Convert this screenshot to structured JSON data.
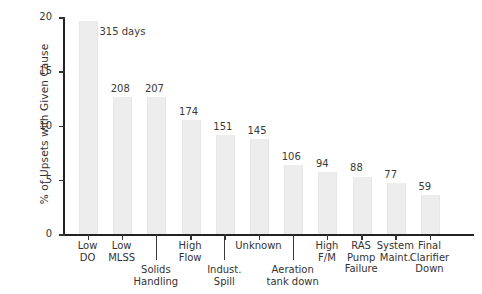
{
  "chart_data": {
    "type": "bar",
    "title": "",
    "xlabel": "",
    "ylabel": "% of Upsets with Given Cause",
    "ylim": [
      0,
      20
    ],
    "yticks": [
      0,
      5,
      10,
      15,
      20
    ],
    "grid": false,
    "legend": null,
    "categories": [
      "Low DO",
      "Low MLSS",
      "Solids Handling",
      "High Flow",
      "Indust. Spill",
      "Unknown",
      "Aeration tank down",
      "High F/M",
      "RAS Pump Failure",
      "System Maint.",
      "Final Clarifier Down"
    ],
    "values": [
      19.6,
      12.6,
      12.6,
      10.5,
      9.1,
      8.8,
      6.4,
      5.7,
      5.3,
      4.7,
      3.6
    ],
    "point_labels": [
      "315 days",
      "208",
      "207",
      "174",
      "151",
      "145",
      "106",
      "94",
      "88",
      "77",
      "59"
    ],
    "counts": [
      315,
      208,
      207,
      174,
      151,
      145,
      106,
      94,
      88,
      77,
      59
    ],
    "bar_color": "#ededed",
    "axis_color": "#222222",
    "text_color": "#333333"
  },
  "axis": {
    "y_title": "% of Upsets with Given Cause",
    "y_tick_labels": [
      "0",
      "5",
      "10",
      "15",
      "20"
    ]
  },
  "x_categories": [
    {
      "line1": "Low",
      "line2": "DO",
      "row": "top"
    },
    {
      "line1": "Low",
      "line2": "MLSS",
      "row": "top"
    },
    {
      "line1": "Solids",
      "line2": "Handling",
      "row": "bottom"
    },
    {
      "line1": "High",
      "line2": "Flow",
      "row": "top"
    },
    {
      "line1": "Indust.",
      "line2": "Spill",
      "row": "bottom"
    },
    {
      "line1": "Unknown",
      "line2": "",
      "row": "top"
    },
    {
      "line1": "Aeration",
      "line2": "tank down",
      "row": "bottom"
    },
    {
      "line1": "High",
      "line2": "F/M",
      "row": "top"
    },
    {
      "line1": "RAS",
      "line2": "Pump",
      "line3": "Failure",
      "row": "top"
    },
    {
      "line1": "System",
      "line2": "Maint.",
      "row": "top"
    },
    {
      "line1": "Final",
      "line2": "Clarifier",
      "line3": "Down",
      "row": "top"
    }
  ],
  "bar_labels": [
    "315 days",
    "208",
    "207",
    "174",
    "151",
    "145",
    "106",
    "94",
    "88",
    "77",
    "59"
  ]
}
